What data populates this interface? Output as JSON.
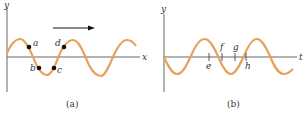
{
  "panel_a": {
    "caption": "(a)",
    "y_axis_label": "y",
    "x_axis_label": "x",
    "arrow_direction": "right",
    "points": [
      {
        "label": "a"
      },
      {
        "label": "b"
      },
      {
        "label": "c"
      },
      {
        "label": "d"
      }
    ]
  },
  "panel_b": {
    "caption": "(b)",
    "y_axis_label": "y",
    "x_axis_label": "t",
    "ticks": [
      {
        "label": "e"
      },
      {
        "label": "f"
      },
      {
        "label": "g"
      },
      {
        "label": "h"
      }
    ]
  },
  "colors": {
    "wave": "#e8a05a",
    "axis": "#666666",
    "point": "#111111"
  }
}
